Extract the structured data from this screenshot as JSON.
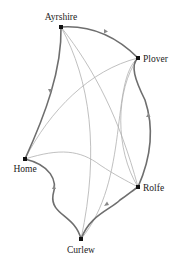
{
  "diagram": {
    "type": "network",
    "nodes": [
      {
        "id": "ayrshire",
        "label": "Ayrshire",
        "x": 61,
        "y": 27,
        "label_x": 61,
        "label_y": 19,
        "anchor": "middle"
      },
      {
        "id": "plover",
        "label": "Plover",
        "x": 138,
        "y": 58,
        "label_x": 143,
        "label_y": 61,
        "anchor": "start"
      },
      {
        "id": "home",
        "label": "Home",
        "x": 25,
        "y": 159,
        "label_x": 25,
        "label_y": 172,
        "anchor": "middle"
      },
      {
        "id": "rolfe",
        "label": "Rolfe",
        "x": 138,
        "y": 187,
        "label_x": 143,
        "label_y": 190,
        "anchor": "start"
      },
      {
        "id": "curlew",
        "label": "Curlew",
        "x": 81,
        "y": 239,
        "label_x": 81,
        "label_y": 253,
        "anchor": "middle"
      }
    ],
    "edges": [
      {
        "from": "ayrshire",
        "to": "plover",
        "weight": "thick",
        "arrow": true
      },
      {
        "from": "rolfe",
        "to": "plover",
        "weight": "thick",
        "arrow": true
      },
      {
        "from": "curlew",
        "to": "rolfe",
        "weight": "thick",
        "arrow": true
      },
      {
        "from": "home",
        "to": "curlew",
        "weight": "thick",
        "arrow": true
      },
      {
        "from": "ayrshire",
        "to": "home",
        "weight": "thick",
        "arrow": true
      },
      {
        "from": "ayrshire",
        "to": "rolfe",
        "weight": "thin",
        "arrow": false
      },
      {
        "from": "ayrshire",
        "to": "curlew",
        "weight": "thin",
        "arrow": false
      },
      {
        "from": "plover",
        "to": "home",
        "weight": "thin",
        "arrow": false
      },
      {
        "from": "plover",
        "to": "curlew",
        "weight": "thin",
        "arrow": false
      },
      {
        "from": "plover",
        "to": "rolfe",
        "weight": "thin",
        "arrow": false
      },
      {
        "from": "home",
        "to": "rolfe",
        "weight": "thin",
        "arrow": false
      }
    ]
  },
  "labels": {
    "ayrshire": "Ayrshire",
    "plover": "Plover",
    "home": "Home",
    "rolfe": "Rolfe",
    "curlew": "Curlew"
  },
  "colors": {
    "thick_edge": "#6e6e6e",
    "thin_edge": "#b0b0b0",
    "node": "#111111",
    "label": "#222222"
  }
}
